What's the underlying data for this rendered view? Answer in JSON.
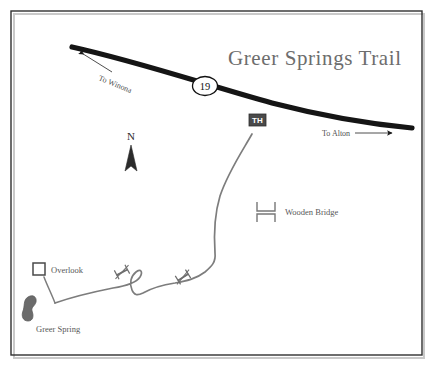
{
  "map": {
    "title": "Greer Springs Trail",
    "background_color": "#ffffff",
    "border_color": "#2f2f2f",
    "highway": {
      "route_number": "19",
      "color": "#151515",
      "west_direction_label": "To Winona",
      "east_direction_label": "To Alton"
    },
    "trail": {
      "color": "#7d7d7d"
    },
    "markers": {
      "trailhead_label": "TH",
      "trailhead_box_color": "#4a4a4a",
      "overlook_label": "Overlook",
      "spring_label": "Greer Spring",
      "spring_color": "#6b6b6b"
    },
    "legend": {
      "wooden_bridge_label": "Wooden Bridge",
      "symbol_color": "#777777"
    },
    "compass": {
      "north_letter": "N",
      "color": "#2b2b2b"
    }
  }
}
